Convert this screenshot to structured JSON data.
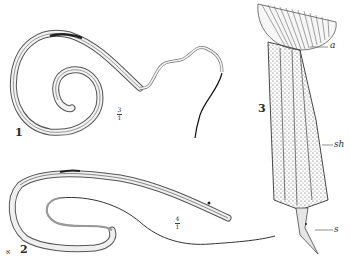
{
  "plate": {
    "figures": [
      {
        "number": "1",
        "description": "coiled nematode worm with long thin tail",
        "scale_numerator": "3",
        "scale_denominator": "1"
      },
      {
        "number": "2",
        "description": "elongated nematode worm bent back with fine filamentous tail",
        "scale_numerator": "4",
        "scale_denominator": "1",
        "corner_mark": "ﬡ"
      },
      {
        "number": "3",
        "description": "magnified anterior/hooked organ with spinose sheath",
        "labels": [
          {
            "text": "a"
          },
          {
            "text": "sh"
          },
          {
            "text": "s"
          }
        ]
      }
    ],
    "colors": {
      "background": "#ffffff",
      "ink": "#2a2a2a",
      "shade": "#8a8a8a"
    }
  }
}
